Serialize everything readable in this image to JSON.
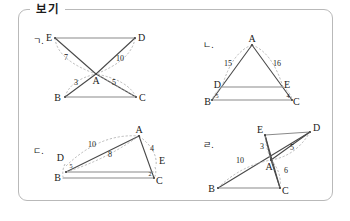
{
  "box": {
    "label": "보기",
    "border_color": "#b9b9b9",
    "background": "#ffffff"
  },
  "style": {
    "solid_stroke": "#4a4a4a",
    "light_stroke": "#8a8a8a",
    "dash_stroke": "#a8a8a8",
    "text_color": "#1a1a1a"
  },
  "items": [
    {
      "marker": "ㄱ.",
      "shape": "hourglass",
      "description": "Two triangles meeting at common vertex A; ED on top, BC on bottom",
      "vertices": [
        {
          "name": "E",
          "x": 52,
          "y": 41,
          "anchor": "end"
        },
        {
          "name": "D",
          "x": 138,
          "y": 41,
          "anchor": "start"
        },
        {
          "name": "A",
          "x": 96,
          "y": 76,
          "anchor": "middle"
        },
        {
          "name": "B",
          "x": 60,
          "y": 99,
          "anchor": "end"
        },
        {
          "name": "C",
          "x": 140,
          "y": 99,
          "anchor": "start"
        }
      ],
      "numbers": [
        {
          "value": "7",
          "x": 66,
          "y": 60,
          "segment": "E-A"
        },
        {
          "value": "10",
          "x": 120,
          "y": 61,
          "segment": "A-D"
        },
        {
          "value": "3",
          "x": 76,
          "y": 85,
          "segment": "B-A"
        },
        {
          "value": "5",
          "x": 114,
          "y": 85,
          "segment": "A-C"
        }
      ]
    },
    {
      "marker": "ㄴ.",
      "shape": "triangle-with-parallel-segment",
      "description": "Triangle ABC with D on AB, E on AC, DE parallel to BC",
      "vertices": [
        {
          "name": "A",
          "x": 252,
          "y": 42,
          "anchor": "middle"
        },
        {
          "name": "D",
          "x": 222,
          "y": 88,
          "anchor": "end"
        },
        {
          "name": "E",
          "x": 283,
          "y": 88,
          "anchor": "start"
        },
        {
          "name": "B",
          "x": 212,
          "y": 102,
          "anchor": "end"
        },
        {
          "name": "C",
          "x": 292,
          "y": 102,
          "anchor": "start"
        }
      ],
      "numbers": [
        {
          "value": "15",
          "x": 228,
          "y": 66,
          "segment": "A-D"
        },
        {
          "value": "16",
          "x": 277,
          "y": 66,
          "segment": "A-E"
        },
        {
          "value": "5",
          "x": 217,
          "y": 98,
          "segment": "D-B"
        },
        {
          "value": "4",
          "x": 288,
          "y": 98,
          "segment": "E-C"
        }
      ]
    },
    {
      "marker": "ㄷ.",
      "shape": "oblique-triangle",
      "description": "Triangle with A top-right, B bottom-left, C bottom-right; D on BA, E on AC",
      "vertices": [
        {
          "name": "A",
          "x": 139,
          "y": 133,
          "anchor": "middle"
        },
        {
          "name": "D",
          "x": 64,
          "y": 159,
          "anchor": "end"
        },
        {
          "name": "E",
          "x": 160,
          "y": 162,
          "anchor": "start"
        },
        {
          "name": "B",
          "x": 60,
          "y": 180,
          "anchor": "end"
        },
        {
          "name": "C",
          "x": 155,
          "y": 181,
          "anchor": "start"
        }
      ],
      "numbers": [
        {
          "value": "10",
          "x": 92,
          "y": 146,
          "segment": "D-A"
        },
        {
          "value": "8",
          "x": 110,
          "y": 156,
          "segment": "B-A"
        },
        {
          "value": "4",
          "x": 152,
          "y": 150,
          "segment": "A-E"
        },
        {
          "value": "5",
          "x": 70,
          "y": 166,
          "segment": "D-B",
          "small": true
        },
        {
          "value": "2",
          "x": 150,
          "y": 173,
          "segment": "E-C",
          "small": true
        }
      ]
    },
    {
      "marker": "ㄹ.",
      "shape": "crossed-quadrilateral",
      "description": "E and D on top, B bottom-left, C bottom-right, A interior intersection",
      "vertices": [
        {
          "name": "E",
          "x": 262,
          "y": 133,
          "anchor": "end"
        },
        {
          "name": "D",
          "x": 312,
          "y": 131,
          "anchor": "start"
        },
        {
          "name": "A",
          "x": 271,
          "y": 163,
          "anchor": "middle"
        },
        {
          "name": "B",
          "x": 215,
          "y": 190,
          "anchor": "end"
        },
        {
          "name": "C",
          "x": 282,
          "y": 190,
          "anchor": "start"
        }
      ],
      "numbers": [
        {
          "value": "3",
          "x": 263,
          "y": 149,
          "segment": "E-A"
        },
        {
          "value": "5",
          "x": 292,
          "y": 150,
          "segment": "A-D"
        },
        {
          "value": "10",
          "x": 240,
          "y": 163,
          "segment": "B-A"
        },
        {
          "value": "6",
          "x": 285,
          "y": 172,
          "segment": "A-C"
        }
      ]
    }
  ]
}
